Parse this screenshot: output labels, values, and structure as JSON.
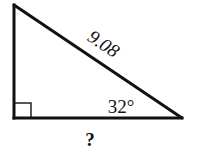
{
  "figure": {
    "type": "right-triangle",
    "hypotenuse_label": "9.08",
    "angle_label": "32°",
    "base_label": "?",
    "right_angle_marker": true,
    "stroke_color": "#111111",
    "background_color": "#ffffff"
  }
}
